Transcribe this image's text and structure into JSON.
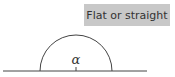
{
  "label": {
    "text": "Flat or straight"
  },
  "diagram": {
    "angle_symbol": "α",
    "angle_type": "straight",
    "colors": {
      "stroke": "#444444",
      "label_bg": "#c8c8c8",
      "label_text": "#333333"
    }
  }
}
